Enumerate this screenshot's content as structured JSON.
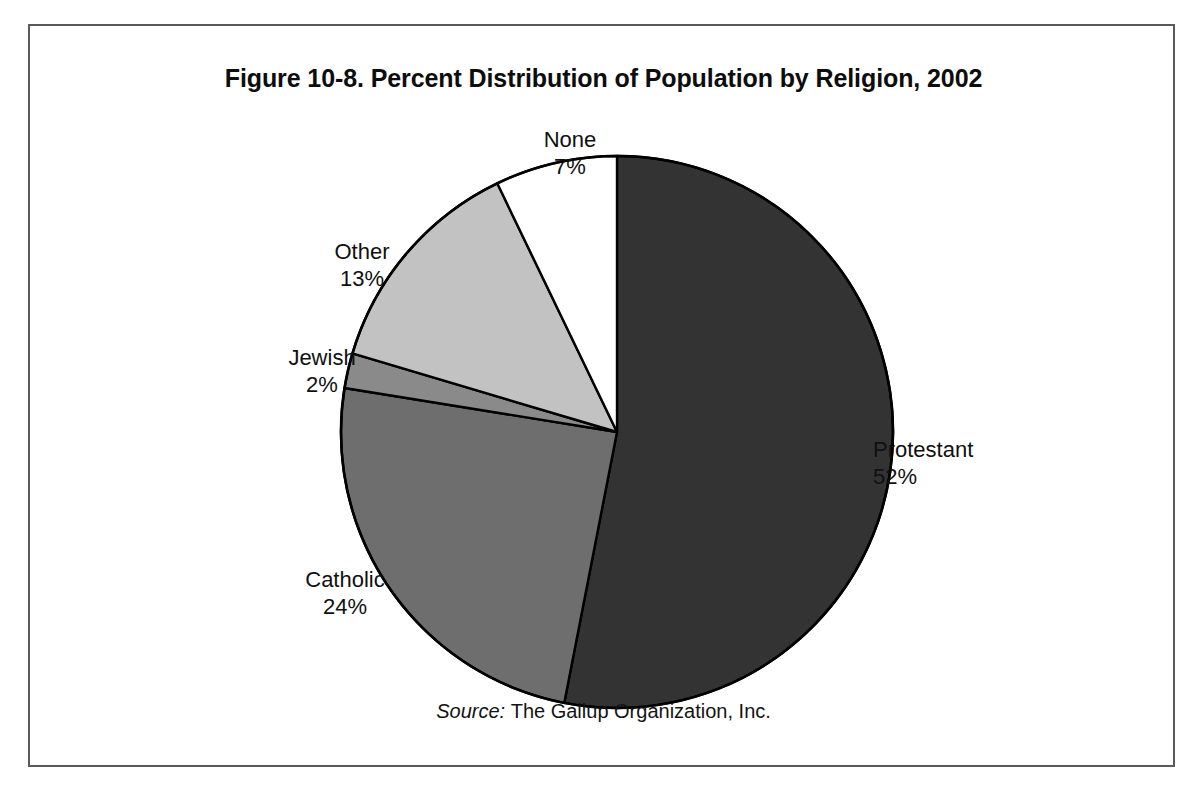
{
  "figure": {
    "title": "Figure 10-8. Percent Distribution of Population by Religion, 2002",
    "source_word": "Source:",
    "source_text": "The Gallup Organization, Inc."
  },
  "labels": {
    "none": {
      "name": "None",
      "value": "7%"
    },
    "other": {
      "name": "Other",
      "value": "13%"
    },
    "jewish": {
      "name": "Jewish",
      "value": "2%"
    },
    "catholic": {
      "name": "Catholic",
      "value": "24%"
    },
    "protestant": {
      "name": "Protestant",
      "value": "52%"
    }
  },
  "colors": {
    "protestant": "#333333",
    "catholic": "#6e6e6e",
    "jewish": "#8a8a8a",
    "other": "#c2c2c2",
    "none": "#ffffff",
    "outline": "#000000",
    "frame": "#5a5a5a",
    "text": "#101010"
  },
  "chart_data": {
    "type": "pie",
    "title": "Figure 10-8. Percent Distribution of Population by Religion, 2002",
    "xlabel": "",
    "ylabel": "",
    "unit": "percent",
    "total": 98,
    "start_angle_deg": 0,
    "direction": "clockwise",
    "legend": "none",
    "labels_position": "outside-callout",
    "categories": [
      "Protestant",
      "Catholic",
      "Jewish",
      "Other",
      "None"
    ],
    "values": [
      52,
      24,
      2,
      13,
      7
    ],
    "slices": [
      {
        "label": "Protestant",
        "value": 52,
        "display": "52%",
        "color": "#333333"
      },
      {
        "label": "Catholic",
        "value": 24,
        "display": "24%",
        "color": "#6e6e6e"
      },
      {
        "label": "Jewish",
        "value": 2,
        "display": "2%",
        "color": "#8a8a8a"
      },
      {
        "label": "Other",
        "value": 13,
        "display": "13%",
        "color": "#c2c2c2"
      },
      {
        "label": "None",
        "value": 7,
        "display": "7%",
        "color": "#ffffff"
      }
    ],
    "annotations": [
      "Source: The Gallup Organization, Inc."
    ]
  }
}
